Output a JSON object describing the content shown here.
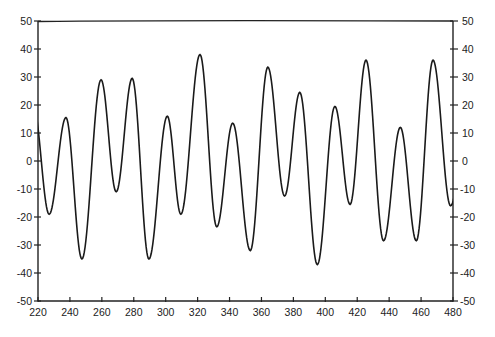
{
  "chart_data": {
    "type": "line",
    "title": "",
    "xlabel": "",
    "ylabel": "",
    "xlim": [
      220,
      480
    ],
    "ylim": [
      -50,
      50
    ],
    "grid": false,
    "legend": null,
    "x_ticks": [
      220,
      240,
      260,
      280,
      300,
      320,
      340,
      360,
      380,
      400,
      420,
      440,
      460,
      480
    ],
    "y_ticks": [
      50,
      40,
      30,
      20,
      10,
      0,
      -10,
      -20,
      -30,
      -40,
      -50
    ],
    "y_ticks_right": [
      50,
      40,
      30,
      20,
      10,
      0,
      -10,
      -20,
      -30,
      -40,
      -50
    ],
    "series": [
      {
        "name": "signal",
        "color": "#1a1a1a",
        "extrema": [
          [
            217,
            20
          ],
          [
            227,
            -19
          ],
          [
            237.5,
            15.5
          ],
          [
            247.5,
            -35
          ],
          [
            259.5,
            29
          ],
          [
            269,
            -11
          ],
          [
            279,
            29.5
          ],
          [
            289.5,
            -35
          ],
          [
            301,
            16
          ],
          [
            309.5,
            -19
          ],
          [
            321.5,
            38
          ],
          [
            332,
            -23.5
          ],
          [
            342,
            13.5
          ],
          [
            353,
            -32
          ],
          [
            364,
            33.5
          ],
          [
            374.5,
            -12.5
          ],
          [
            384,
            24.5
          ],
          [
            395,
            -37
          ],
          [
            406,
            19.5
          ],
          [
            415.5,
            -15.5
          ],
          [
            425.5,
            36
          ],
          [
            436.5,
            -28.5
          ],
          [
            447,
            12
          ],
          [
            457,
            -28.5
          ],
          [
            467.5,
            36
          ],
          [
            478.5,
            -16
          ],
          [
            488,
            10
          ]
        ]
      }
    ]
  },
  "layout": {
    "plot_left": 38,
    "plot_right": 453,
    "plot_top": 21,
    "plot_bottom": 301
  }
}
